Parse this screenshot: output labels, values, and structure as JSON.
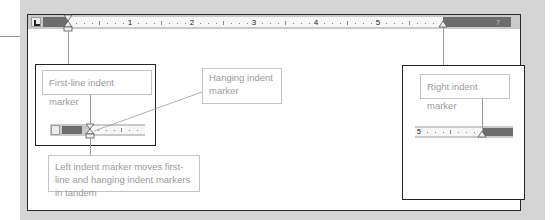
{
  "ruler": {
    "numbers": [
      "1",
      "2",
      "3",
      "4",
      "5"
    ],
    "right_numbers": [
      "6",
      "7"
    ],
    "colors": {
      "margin": "#6d6d6d",
      "ruler_bg": "#f7f7f7",
      "frame": "#c9c9c9"
    }
  },
  "callouts": {
    "first_line": "First-line indent marker",
    "hanging": "Hanging indent marker",
    "left_indent": "Left indent marker moves first-line and hanging indent markers in tandem",
    "right_indent": "Right indent marker"
  },
  "mini_ruler_right": {
    "number": "5"
  }
}
